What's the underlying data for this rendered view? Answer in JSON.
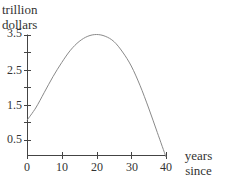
{
  "chart_data": {
    "type": "line",
    "title": "",
    "ylabel": "trillion dollars",
    "ylabel_lines": [
      "trillion",
      "dollars"
    ],
    "xlabel": "years since 2000",
    "xlabel_lines": [
      "years since",
      "2000"
    ],
    "xlim": [
      0,
      40
    ],
    "ylim": [
      0,
      3.5
    ],
    "xticks": [
      0,
      10,
      20,
      30,
      40
    ],
    "xtick_labels": [
      "0",
      "10",
      "20",
      "30",
      "40"
    ],
    "yticks": [
      0.5,
      1,
      1.5,
      2,
      2.5,
      3,
      3.5
    ],
    "ytick_labels": [
      "0.5",
      "",
      "1.5",
      "",
      "2.5",
      "",
      "3.5"
    ],
    "grid": false,
    "legend": null,
    "series": [
      {
        "name": "curve",
        "x": [
          0,
          2.5,
          5,
          7.5,
          10,
          12.5,
          15,
          17.5,
          20,
          22.5,
          25,
          27.5,
          30,
          32.5,
          35,
          37.5,
          40
        ],
        "values": [
          1.05,
          1.4,
          1.85,
          2.3,
          2.7,
          3.05,
          3.3,
          3.45,
          3.5,
          3.45,
          3.3,
          3.0,
          2.6,
          2.05,
          1.4,
          0.7,
          0.0
        ]
      }
    ]
  }
}
